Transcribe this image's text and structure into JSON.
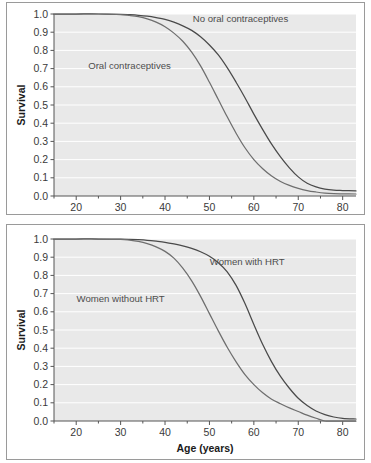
{
  "figure": {
    "background_color": "#ffffff",
    "frame_color": "#9a9a9a",
    "plot_background_color": "#e9e9e9",
    "gridline_color": "#ffffff",
    "axis_color": "#555555"
  },
  "chart_data": [
    {
      "type": "line",
      "panel": "top",
      "title": "",
      "xlabel": "Age (years)",
      "ylabel": "Survival",
      "xlim": [
        15,
        83
      ],
      "ylim": [
        0.0,
        1.0
      ],
      "xticks": [
        20,
        30,
        40,
        50,
        60,
        70,
        80
      ],
      "xtick_labels": [
        "20",
        "30",
        "40",
        "50",
        "60",
        "70",
        "80"
      ],
      "xminorticks": [
        15,
        25,
        35,
        45,
        55,
        65,
        75
      ],
      "yticks": [
        0.0,
        0.1,
        0.2,
        0.3,
        0.4,
        0.5,
        0.6,
        0.7,
        0.8,
        0.9,
        1.0
      ],
      "ytick_labels": [
        "0.0",
        "0.1",
        "0.2",
        "0.3",
        "0.4",
        "0.5",
        "0.6",
        "0.7",
        "0.8",
        "0.9",
        "1.0"
      ],
      "grid": true,
      "grid_axis": "y",
      "legend_position": "inline-annotation",
      "series": [
        {
          "name": "No oral contraceptives",
          "color": "#4a4a4a",
          "label_position": {
            "x": 57.0,
            "y": 0.955
          },
          "x": [
            15,
            20,
            25,
            30,
            32,
            34,
            36,
            38,
            40,
            42,
            44,
            46,
            48,
            50,
            52,
            54,
            56,
            58,
            60,
            62,
            64,
            66,
            68,
            70,
            72,
            74,
            76,
            78,
            80,
            83
          ],
          "y": [
            1.0,
            1.0,
            1.0,
            0.998,
            0.996,
            0.993,
            0.988,
            0.98,
            0.97,
            0.955,
            0.935,
            0.91,
            0.875,
            0.83,
            0.775,
            0.705,
            0.625,
            0.54,
            0.45,
            0.365,
            0.285,
            0.215,
            0.155,
            0.105,
            0.07,
            0.05,
            0.038,
            0.032,
            0.03,
            0.028
          ]
        },
        {
          "name": "Oral contraceptives",
          "color": "#6e6e6e",
          "label_position": {
            "x": 32.0,
            "y": 0.7
          },
          "x": [
            15,
            20,
            25,
            30,
            32,
            34,
            36,
            38,
            40,
            42,
            44,
            46,
            48,
            50,
            52,
            54,
            56,
            58,
            60,
            62,
            64,
            66,
            68,
            70,
            72,
            74,
            76,
            78,
            80,
            83
          ],
          "y": [
            1.0,
            1.0,
            1.0,
            0.997,
            0.992,
            0.985,
            0.973,
            0.955,
            0.93,
            0.895,
            0.85,
            0.79,
            0.715,
            0.625,
            0.53,
            0.435,
            0.345,
            0.265,
            0.2,
            0.15,
            0.11,
            0.08,
            0.058,
            0.042,
            0.03,
            0.022,
            0.016,
            0.013,
            0.012,
            0.011
          ]
        }
      ]
    },
    {
      "type": "line",
      "panel": "bottom",
      "title": "",
      "xlabel": "Age (years)",
      "ylabel": "Survival",
      "xlim": [
        15,
        83
      ],
      "ylim": [
        0.0,
        1.0
      ],
      "xticks": [
        20,
        30,
        40,
        50,
        60,
        70,
        80
      ],
      "xtick_labels": [
        "20",
        "30",
        "40",
        "50",
        "60",
        "70",
        "80"
      ],
      "xminorticks": [
        15,
        25,
        35,
        45,
        55,
        65,
        75
      ],
      "yticks": [
        0.0,
        0.1,
        0.2,
        0.3,
        0.4,
        0.5,
        0.6,
        0.7,
        0.8,
        0.9,
        1.0
      ],
      "ytick_labels": [
        "0.0",
        "0.1",
        "0.2",
        "0.3",
        "0.4",
        "0.5",
        "0.6",
        "0.7",
        "0.8",
        "0.9",
        "1.0"
      ],
      "grid": true,
      "grid_axis": "y",
      "legend_position": "inline-annotation",
      "series": [
        {
          "name": "Women with HRT",
          "color": "#4a4a4a",
          "label_position": {
            "x": 58.5,
            "y": 0.855
          },
          "x": [
            15,
            20,
            25,
            30,
            32,
            34,
            36,
            38,
            40,
            42,
            44,
            46,
            48,
            50,
            52,
            54,
            56,
            58,
            60,
            62,
            64,
            66,
            68,
            70,
            72,
            74,
            76,
            78,
            80,
            83
          ],
          "y": [
            1.0,
            1.0,
            1.0,
            0.999,
            0.998,
            0.996,
            0.993,
            0.988,
            0.982,
            0.973,
            0.962,
            0.948,
            0.93,
            0.905,
            0.87,
            0.82,
            0.745,
            0.645,
            0.53,
            0.42,
            0.325,
            0.245,
            0.18,
            0.125,
            0.085,
            0.055,
            0.035,
            0.022,
            0.015,
            0.011
          ]
        },
        {
          "name": "Women without HRT",
          "color": "#6e6e6e",
          "label_position": {
            "x": 30.0,
            "y": 0.655
          },
          "x": [
            15,
            20,
            25,
            30,
            32,
            34,
            36,
            38,
            40,
            42,
            44,
            46,
            48,
            50,
            52,
            54,
            56,
            58,
            60,
            62,
            64,
            66,
            68,
            70,
            72,
            74,
            76,
            78,
            80,
            83
          ],
          "y": [
            1.0,
            1.0,
            1.0,
            0.998,
            0.994,
            0.987,
            0.975,
            0.957,
            0.932,
            0.895,
            0.84,
            0.77,
            0.685,
            0.59,
            0.495,
            0.405,
            0.325,
            0.255,
            0.2,
            0.155,
            0.12,
            0.095,
            0.072,
            0.052,
            0.032,
            0.015,
            0.0,
            0.0,
            0.0,
            0.0
          ]
        }
      ]
    }
  ]
}
